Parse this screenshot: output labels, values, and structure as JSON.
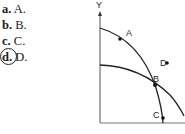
{
  "question": {
    "choices": [
      {
        "letter": "a.",
        "text": "A.",
        "selected": false
      },
      {
        "letter": "b.",
        "text": "B.",
        "selected": false
      },
      {
        "letter": "c.",
        "text": "C.",
        "selected": false
      },
      {
        "letter": "d.",
        "text": "D.",
        "selected": true
      }
    ]
  },
  "diagram": {
    "y_axis_label": "Y",
    "points": [
      {
        "label": "A"
      },
      {
        "label": "B"
      },
      {
        "label": "C"
      },
      {
        "label": "D"
      }
    ]
  }
}
